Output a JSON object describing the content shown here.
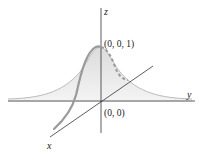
{
  "diagram": {
    "type": "3d-surface-sketch",
    "axes": {
      "x_label": "x",
      "y_label": "y",
      "z_label": "z"
    },
    "points": {
      "peak_label": "(0, 0, 1)",
      "origin_label": "(0, 0)"
    },
    "colors": {
      "axis": "#333333",
      "surface_fill": "#e6e6e6",
      "surface_edge": "#bbbbbb",
      "curve": "#999999",
      "text": "#222222"
    }
  }
}
